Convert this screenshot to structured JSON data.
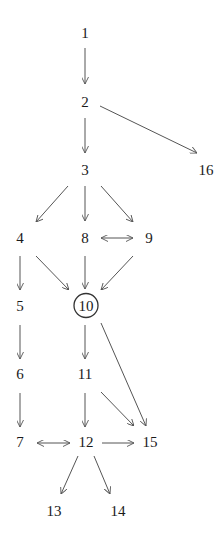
{
  "diagram": {
    "type": "directed-graph",
    "nodes": [
      {
        "id": "1",
        "label": "1"
      },
      {
        "id": "2",
        "label": "2"
      },
      {
        "id": "3",
        "label": "3"
      },
      {
        "id": "16",
        "label": "16"
      },
      {
        "id": "4",
        "label": "4"
      },
      {
        "id": "8",
        "label": "8"
      },
      {
        "id": "9",
        "label": "9"
      },
      {
        "id": "5",
        "label": "5"
      },
      {
        "id": "10",
        "label": "10",
        "highlighted": true
      },
      {
        "id": "6",
        "label": "6"
      },
      {
        "id": "11",
        "label": "11"
      },
      {
        "id": "7",
        "label": "7"
      },
      {
        "id": "12",
        "label": "12"
      },
      {
        "id": "15",
        "label": "15"
      },
      {
        "id": "13",
        "label": "13"
      },
      {
        "id": "14",
        "label": "14"
      }
    ],
    "edges": [
      {
        "from": "1",
        "to": "2"
      },
      {
        "from": "2",
        "to": "3"
      },
      {
        "from": "2",
        "to": "16"
      },
      {
        "from": "3",
        "to": "4"
      },
      {
        "from": "3",
        "to": "8"
      },
      {
        "from": "3",
        "to": "9"
      },
      {
        "from": "8",
        "to": "9",
        "bidirectional": true
      },
      {
        "from": "4",
        "to": "5"
      },
      {
        "from": "4",
        "to": "10"
      },
      {
        "from": "8",
        "to": "10"
      },
      {
        "from": "9",
        "to": "10"
      },
      {
        "from": "5",
        "to": "6"
      },
      {
        "from": "10",
        "to": "11"
      },
      {
        "from": "10",
        "to": "15"
      },
      {
        "from": "6",
        "to": "7"
      },
      {
        "from": "11",
        "to": "12"
      },
      {
        "from": "11",
        "to": "15"
      },
      {
        "from": "7",
        "to": "12",
        "bidirectional": true
      },
      {
        "from": "12",
        "to": "15"
      },
      {
        "from": "12",
        "to": "13"
      },
      {
        "from": "12",
        "to": "14"
      }
    ]
  }
}
